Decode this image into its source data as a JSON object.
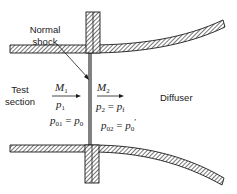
{
  "diagram": {
    "labels": {
      "normal_shock": [
        "Normal",
        "shock"
      ],
      "test_section": [
        "Test",
        "section"
      ],
      "diffuser": "Diffuser"
    },
    "upstream": {
      "mach": {
        "sym": "M",
        "sub": "1"
      },
      "pressure": {
        "sym": "p",
        "sub": "1"
      },
      "stagnation": {
        "lhs": "p",
        "lhs_sub": "01",
        "eq": " = ",
        "rhs": "p",
        "rhs_sub": "0"
      }
    },
    "downstream": {
      "mach": {
        "sym": "M",
        "sub": "2"
      },
      "pressure": {
        "lhs": "p",
        "lhs_sub": "2",
        "eq": " = ",
        "rhs": "p",
        "rhs_sub": "f"
      },
      "stagnation": {
        "lhs": "p",
        "lhs_sub": "02",
        "eq": " = ",
        "rhs": "p",
        "rhs_sub": "0",
        "prime": "′"
      }
    },
    "colors": {
      "line": "#1a1a1a",
      "background": "#ffffff"
    }
  }
}
